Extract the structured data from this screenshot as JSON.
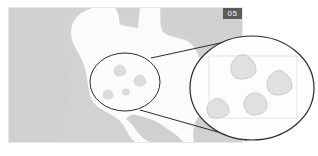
{
  "figure": {
    "panel_label": "05",
    "domain": "micrograph-with-magnifier-callout"
  },
  "colors": {
    "background": "#ffffff",
    "plate_base": "#d2d2d2",
    "region_light": "#fcfcfc",
    "region_mid": "#d0d0d0",
    "particle_fill": "#dcdcdc",
    "particle_stroke": "#c2c2c2",
    "callout_stroke": "#2a2a2a",
    "magnifier_fill": "#fdfdfd",
    "crop_box_stroke": "#e4e4e4",
    "label_bg": "#5b5b5b",
    "label_text": "#ffffff"
  },
  "plate": {
    "x": 8,
    "y": 7,
    "width": 235,
    "height": 136,
    "description": "grayscale segmented field with light foreground mass on mid-gray background"
  },
  "source_region": {
    "name": "source-ellipse",
    "cx": 125,
    "cy": 82,
    "rx": 35,
    "ry": 29
  },
  "magnified_region": {
    "name": "magnifier-ellipse",
    "cx": 252,
    "cy": 88,
    "rx": 62,
    "ry": 52,
    "crop_box": {
      "x": 209,
      "y": 56,
      "width": 88,
      "height": 62
    }
  },
  "connector_lines": [
    {
      "from_x": 151,
      "from_y": 58,
      "to_x": 248,
      "to_y": 37
    },
    {
      "from_x": 140,
      "from_y": 110,
      "to_x": 246,
      "to_y": 140
    }
  ],
  "particles_source": [
    {
      "id": "p1",
      "cx": 120,
      "cy": 70,
      "r": 5,
      "shape": "triangle"
    },
    {
      "id": "p2",
      "cx": 140,
      "cy": 80,
      "r": 5,
      "shape": "triangle"
    },
    {
      "id": "p3",
      "cx": 108,
      "cy": 95,
      "r": 4,
      "shape": "triangle"
    },
    {
      "id": "p4",
      "cx": 126,
      "cy": 92,
      "r": 3,
      "shape": "round"
    }
  ],
  "particles_magnified": [
    {
      "id": "m1",
      "cx": 244,
      "cy": 67,
      "r": 13,
      "shape": "triangle"
    },
    {
      "id": "m2",
      "cx": 280,
      "cy": 83,
      "r": 13,
      "shape": "triangle"
    },
    {
      "id": "m3",
      "cx": 219,
      "cy": 110,
      "r": 11,
      "shape": "triangle"
    },
    {
      "id": "m4",
      "cx": 255,
      "cy": 105,
      "r": 11,
      "shape": "round"
    }
  ]
}
